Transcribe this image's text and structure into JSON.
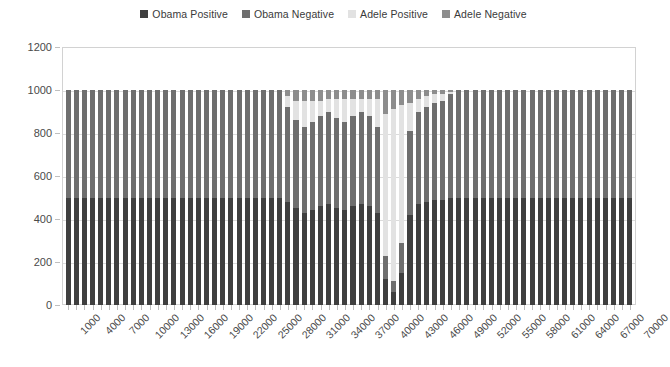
{
  "legend": {
    "position": "top-center",
    "items": [
      {
        "label": "Obama Positive",
        "color": "#3f3f3f"
      },
      {
        "label": "Obama Negative",
        "color": "#6e6e6e"
      },
      {
        "label": "Adele Positive",
        "color": "#e2e2e2"
      },
      {
        "label": "Adele Negative",
        "color": "#8d8d8d"
      }
    ]
  },
  "axes": {
    "y": {
      "ticks": [
        "0",
        "200",
        "400",
        "600",
        "800",
        "1000",
        "1200"
      ],
      "min": 0,
      "max": 1200,
      "step": 200
    },
    "x": {
      "ticks": [
        "1000",
        "4000",
        "7000",
        "10000",
        "13000",
        "16000",
        "19000",
        "22000",
        "25000",
        "28000",
        "31000",
        "34000",
        "37000",
        "40000",
        "43000",
        "46000",
        "49000",
        "52000",
        "55000",
        "58000",
        "61000",
        "64000",
        "67000",
        "70000"
      ],
      "min": 1000,
      "max": 70000,
      "step": 3000
    }
  },
  "chart_data": {
    "type": "bar",
    "title": "",
    "xlabel": "",
    "ylabel": "",
    "ylim": [
      0,
      1200
    ],
    "stacked": true,
    "grid": true,
    "legend_position": "top-center",
    "colors": {
      "obama_positive": "#3f3f3f",
      "obama_negative": "#6e6e6e",
      "adele_positive": "#e2e2e2",
      "adele_negative": "#8d8d8d"
    },
    "categories": [
      1000,
      2000,
      3000,
      4000,
      5000,
      6000,
      7000,
      8000,
      9000,
      10000,
      11000,
      12000,
      13000,
      14000,
      15000,
      16000,
      17000,
      18000,
      19000,
      20000,
      21000,
      22000,
      23000,
      24000,
      25000,
      26000,
      27000,
      28000,
      29000,
      30000,
      31000,
      32000,
      33000,
      34000,
      35000,
      36000,
      37000,
      38000,
      39000,
      40000,
      41000,
      42000,
      43000,
      44000,
      45000,
      46000,
      47000,
      48000,
      49000,
      50000,
      51000,
      52000,
      53000,
      54000,
      55000,
      56000,
      57000,
      58000,
      59000,
      60000,
      61000,
      62000,
      63000,
      64000,
      65000,
      66000,
      67000,
      68000,
      69000,
      70000
    ],
    "series": [
      {
        "name": "Obama Positive",
        "color": "#3f3f3f",
        "values": [
          500,
          500,
          500,
          500,
          500,
          500,
          500,
          500,
          500,
          500,
          500,
          500,
          500,
          500,
          500,
          500,
          500,
          500,
          500,
          500,
          500,
          500,
          500,
          500,
          500,
          500,
          500,
          480,
          450,
          430,
          440,
          460,
          470,
          450,
          440,
          460,
          470,
          460,
          430,
          120,
          60,
          150,
          420,
          470,
          480,
          490,
          490,
          500,
          500,
          500,
          500,
          500,
          500,
          500,
          500,
          500,
          500,
          500,
          500,
          500,
          500,
          500,
          500,
          500,
          500,
          500,
          500,
          500,
          500,
          500
        ]
      },
      {
        "name": "Obama Negative",
        "color": "#6e6e6e",
        "values": [
          500,
          500,
          500,
          500,
          500,
          500,
          500,
          500,
          500,
          500,
          500,
          500,
          500,
          500,
          500,
          500,
          500,
          500,
          500,
          500,
          500,
          500,
          500,
          500,
          500,
          500,
          500,
          440,
          410,
          400,
          410,
          420,
          430,
          420,
          410,
          420,
          430,
          420,
          400,
          110,
          50,
          140,
          390,
          430,
          440,
          450,
          460,
          480,
          500,
          500,
          500,
          500,
          500,
          500,
          500,
          500,
          500,
          500,
          500,
          500,
          500,
          500,
          500,
          500,
          500,
          500,
          500,
          500,
          500,
          500
        ]
      },
      {
        "name": "Adele Positive",
        "color": "#e2e2e2",
        "values": [
          0,
          0,
          0,
          0,
          0,
          0,
          0,
          0,
          0,
          0,
          0,
          0,
          0,
          0,
          0,
          0,
          0,
          0,
          0,
          0,
          0,
          0,
          0,
          0,
          0,
          0,
          0,
          50,
          90,
          120,
          100,
          70,
          60,
          90,
          110,
          80,
          60,
          80,
          130,
          660,
          800,
          640,
          130,
          60,
          50,
          40,
          30,
          10,
          0,
          0,
          0,
          0,
          0,
          0,
          0,
          0,
          0,
          0,
          0,
          0,
          0,
          0,
          0,
          0,
          0,
          0,
          0,
          0,
          0,
          0
        ]
      },
      {
        "name": "Adele Negative",
        "color": "#8d8d8d",
        "values": [
          0,
          0,
          0,
          0,
          0,
          0,
          0,
          0,
          0,
          0,
          0,
          0,
          0,
          0,
          0,
          0,
          0,
          0,
          0,
          0,
          0,
          0,
          0,
          0,
          0,
          0,
          0,
          30,
          50,
          50,
          50,
          50,
          40,
          40,
          40,
          40,
          40,
          40,
          40,
          110,
          90,
          70,
          60,
          40,
          30,
          20,
          20,
          10,
          0,
          0,
          0,
          0,
          0,
          0,
          0,
          0,
          0,
          0,
          0,
          0,
          0,
          0,
          0,
          0,
          0,
          0,
          0,
          0,
          0,
          0
        ]
      }
    ]
  }
}
